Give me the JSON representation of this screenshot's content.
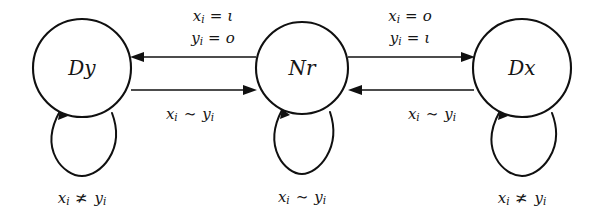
{
  "diagram": {
    "type": "state-transition-diagram",
    "title": "",
    "background_color": "#ffffff",
    "stroke_color": "#101010",
    "nodes": [
      {
        "id": "Dy",
        "label": "Dy",
        "cx": 82,
        "cy": 68,
        "r": 49
      },
      {
        "id": "Nr",
        "label": "Nr",
        "cx": 302,
        "cy": 68,
        "r": 46
      },
      {
        "id": "Dx",
        "label": "Dx",
        "cx": 522,
        "cy": 68,
        "r": 49
      }
    ],
    "transitions": [
      {
        "id": "nr-to-dy",
        "from": "Nr",
        "to": "Dy",
        "direction": "left",
        "label_lines": [
          {
            "lhs": "x",
            "sub": "i",
            "op": "=",
            "rhs": "ι"
          },
          {
            "lhs": "y",
            "sub": "i",
            "op": "=",
            "rhs": "o"
          }
        ]
      },
      {
        "id": "dy-to-nr",
        "from": "Dy",
        "to": "Nr",
        "direction": "right",
        "label_lines": [
          {
            "lhs": "x",
            "sub": "i",
            "op": "∼",
            "rhs": "y",
            "rhs_sub": "i"
          }
        ]
      },
      {
        "id": "nr-to-dx",
        "from": "Nr",
        "to": "Dx",
        "direction": "right",
        "label_lines": [
          {
            "lhs": "x",
            "sub": "i",
            "op": "=",
            "rhs": "o"
          },
          {
            "lhs": "y",
            "sub": "i",
            "op": "=",
            "rhs": "ι"
          }
        ]
      },
      {
        "id": "dx-to-nr",
        "from": "Dx",
        "to": "Nr",
        "direction": "left",
        "label_lines": [
          {
            "lhs": "x",
            "sub": "i",
            "op": "∼",
            "rhs": "y",
            "rhs_sub": "i"
          }
        ]
      }
    ],
    "self_loops": [
      {
        "id": "loop-dy",
        "node": "Dy",
        "label": {
          "lhs": "x",
          "sub": "i",
          "op": "≭",
          "rhs": "y",
          "rhs_sub": "i"
        }
      },
      {
        "id": "loop-nr",
        "node": "Nr",
        "label": {
          "lhs": "x",
          "sub": "i",
          "op": "∼",
          "rhs": "y",
          "rhs_sub": "i"
        }
      },
      {
        "id": "loop-dx",
        "node": "Dx",
        "label": {
          "lhs": "x",
          "sub": "i",
          "op": "≭",
          "rhs": "y",
          "rhs_sub": "i"
        }
      }
    ],
    "labels": {
      "node_dy": "Dy",
      "node_nr": "Nr",
      "node_dx": "Dx",
      "edge_nr_dy_line1_var": "x",
      "edge_nr_dy_line1_sub": "i",
      "edge_nr_dy_line1_op": "=",
      "edge_nr_dy_line1_val": "ι",
      "edge_nr_dy_line2_var": "y",
      "edge_nr_dy_line2_sub": "i",
      "edge_nr_dy_line2_op": "=",
      "edge_nr_dy_line2_val": "o",
      "edge_nr_dx_line1_var": "x",
      "edge_nr_dx_line1_sub": "i",
      "edge_nr_dx_line1_op": "=",
      "edge_nr_dx_line1_val": "o",
      "edge_nr_dx_line2_var": "y",
      "edge_nr_dx_line2_sub": "i",
      "edge_nr_dx_line2_op": "=",
      "edge_nr_dx_line2_val": "ι",
      "edge_dy_nr_var": "x",
      "edge_dy_nr_sub": "i",
      "edge_dy_nr_op": "∼",
      "edge_dy_nr_val": "y",
      "edge_dy_nr_val_sub": "i",
      "edge_dx_nr_var": "x",
      "edge_dx_nr_sub": "i",
      "edge_dx_nr_op": "∼",
      "edge_dx_nr_val": "y",
      "edge_dx_nr_val_sub": "i",
      "loop_dy_var": "x",
      "loop_dy_sub": "i",
      "loop_dy_op": "≭",
      "loop_dy_val": "y",
      "loop_dy_val_sub": "i",
      "loop_nr_var": "x",
      "loop_nr_sub": "i",
      "loop_nr_op": "∼",
      "loop_nr_val": "y",
      "loop_nr_val_sub": "i",
      "loop_dx_var": "x",
      "loop_dx_sub": "i",
      "loop_dx_op": "≭",
      "loop_dx_val": "y",
      "loop_dx_val_sub": "i"
    }
  }
}
